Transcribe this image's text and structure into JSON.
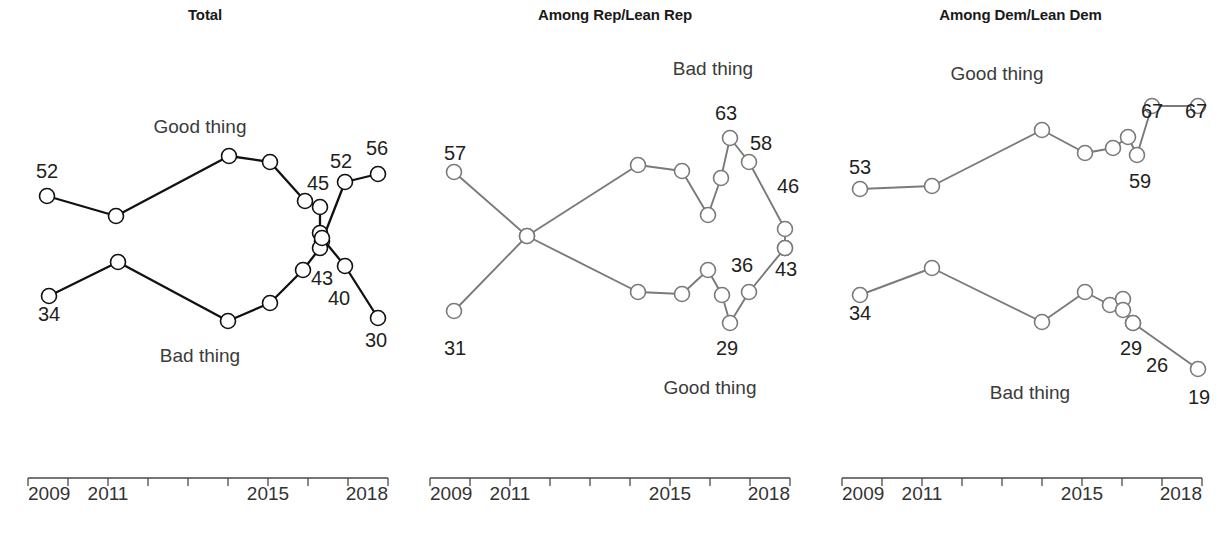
{
  "figure": {
    "background": "#ffffff",
    "panel_count": 3
  },
  "panels": [
    {
      "id": "total",
      "title": "Total",
      "line_color": "#111111",
      "marker_stroke": "#111111",
      "series_labels": [
        {
          "text": "Good thing",
          "x": 200,
          "y": 133
        },
        {
          "text": "Bad thing",
          "x": 200,
          "y": 362
        }
      ],
      "value_labels": [
        {
          "text": "52",
          "x": 47,
          "y": 178,
          "anchor": "middle"
        },
        {
          "text": "45",
          "x": 318,
          "y": 190,
          "anchor": "middle"
        },
        {
          "text": "52",
          "x": 341,
          "y": 168,
          "anchor": "middle"
        },
        {
          "text": "56",
          "x": 377,
          "y": 155,
          "anchor": "middle"
        },
        {
          "text": "34",
          "x": 49,
          "y": 321,
          "anchor": "middle"
        },
        {
          "text": "43",
          "x": 322,
          "y": 285,
          "anchor": "middle"
        },
        {
          "text": "40",
          "x": 339,
          "y": 305,
          "anchor": "middle"
        },
        {
          "text": "30",
          "x": 376,
          "y": 347,
          "anchor": "middle"
        }
      ],
      "axis": {
        "x0": 28,
        "x1": 388,
        "y": 478,
        "tick_count": 10,
        "tick_len": 8,
        "labels": [
          {
            "text": "2009",
            "x": 28,
            "y": 500
          },
          {
            "text": "2011",
            "x": 108,
            "y": 500
          },
          {
            "text": "2015",
            "x": 268,
            "y": 500
          },
          {
            "text": "2018",
            "x": 388,
            "y": 500
          }
        ]
      }
    },
    {
      "id": "rep_lean_rep",
      "title": "Among Rep/Lean Rep",
      "line_color": "#7a7a7a",
      "marker_stroke": "#7a7a7a",
      "series_labels": [
        {
          "text": "Bad thing",
          "x": 303,
          "y": 75
        },
        {
          "text": "Good thing",
          "x": 300,
          "y": 394
        }
      ],
      "value_labels": [
        {
          "text": "57",
          "x": 45,
          "y": 160,
          "anchor": "middle"
        },
        {
          "text": "31",
          "x": 45,
          "y": 355,
          "anchor": "middle"
        },
        {
          "text": "63",
          "x": 316,
          "y": 120,
          "anchor": "middle"
        },
        {
          "text": "58",
          "x": 351,
          "y": 150,
          "anchor": "middle"
        },
        {
          "text": "46",
          "x": 378,
          "y": 193,
          "anchor": "middle"
        },
        {
          "text": "36",
          "x": 332,
          "y": 272,
          "anchor": "middle"
        },
        {
          "text": "43",
          "x": 376,
          "y": 276,
          "anchor": "middle"
        },
        {
          "text": "29",
          "x": 317,
          "y": 355,
          "anchor": "middle"
        }
      ],
      "axis": {
        "x0": 20,
        "x1": 380,
        "y": 478,
        "tick_count": 10,
        "tick_len": 8,
        "labels": [
          {
            "text": "2009",
            "x": 20,
            "y": 500
          },
          {
            "text": "2011",
            "x": 100,
            "y": 500
          },
          {
            "text": "2015",
            "x": 260,
            "y": 500
          },
          {
            "text": "2018",
            "x": 380,
            "y": 500
          }
        ]
      }
    },
    {
      "id": "dem_lean_dem",
      "title": "Among Dem/Lean Dem",
      "line_color": "#7a7a7a",
      "marker_stroke": "#7a7a7a",
      "series_labels": [
        {
          "text": "Good thing",
          "x": 177,
          "y": 80
        },
        {
          "text": "Bad thing",
          "x": 210,
          "y": 399
        }
      ],
      "value_labels": [
        {
          "text": "53",
          "x": 40,
          "y": 174,
          "anchor": "middle"
        },
        {
          "text": "67",
          "x": 332,
          "y": 118,
          "anchor": "middle"
        },
        {
          "text": "67",
          "x": 376,
          "y": 118,
          "anchor": "middle"
        },
        {
          "text": "59",
          "x": 320,
          "y": 188,
          "anchor": "middle"
        },
        {
          "text": "34",
          "x": 40,
          "y": 320,
          "anchor": "middle"
        },
        {
          "text": "29",
          "x": 311,
          "y": 355,
          "anchor": "middle"
        },
        {
          "text": "26",
          "x": 337,
          "y": 372,
          "anchor": "middle"
        },
        {
          "text": "19",
          "x": 379,
          "y": 404,
          "anchor": "middle"
        }
      ],
      "axis": {
        "x0": 22,
        "x1": 382,
        "y": 478,
        "tick_count": 10,
        "tick_len": 8,
        "labels": [
          {
            "text": "2009",
            "x": 22,
            "y": 500
          },
          {
            "text": "2011",
            "x": 102,
            "y": 500
          },
          {
            "text": "2015",
            "x": 262,
            "y": 500
          },
          {
            "text": "2018",
            "x": 382,
            "y": 500
          }
        ]
      }
    }
  ],
  "chart_data": [
    {
      "type": "line",
      "title": "Total",
      "xlabel": "",
      "ylabel": "",
      "grid": false,
      "legend": "inline-labels",
      "xlim": [
        2009,
        2018.5
      ],
      "ylim": [
        25,
        60
      ],
      "x_ticks": [
        2009,
        2010,
        2011,
        2012,
        2013,
        2014,
        2015,
        2016,
        2017,
        2018
      ],
      "x_tick_labels": [
        "2009",
        "",
        "2011",
        "",
        "",
        "",
        "2015",
        "",
        "",
        "2018"
      ],
      "series": [
        {
          "name": "Good thing",
          "color": "#111111",
          "points": [
            {
              "x": 2009.3,
              "y": 52,
              "px": 47,
              "py": 196,
              "label": "52"
            },
            {
              "x": 2011.0,
              "y": 49,
              "px": 116,
              "py": 216,
              "label": ""
            },
            {
              "x": 2014.0,
              "y": 57,
              "px": 229,
              "py": 156,
              "label": ""
            },
            {
              "x": 2015.0,
              "y": 56,
              "px": 270,
              "py": 162,
              "label": ""
            },
            {
              "x": 2016.3,
              "y": 45,
              "px": 305,
              "py": 201,
              "label": "45"
            },
            {
              "x": 2016.7,
              "y": 44,
              "px": 320,
              "py": 207,
              "label": ""
            },
            {
              "x": 2017.0,
              "y": 40,
              "px": 320,
              "py": 233,
              "label": ""
            },
            {
              "x": 2017.2,
              "y": 39,
              "px": 322,
              "py": 241,
              "label": ""
            },
            {
              "x": 2017.5,
              "y": 52,
              "px": 345,
              "py": 182,
              "label": "52"
            },
            {
              "x": 2018.2,
              "y": 56,
              "px": 378,
              "py": 174,
              "label": "56"
            }
          ]
        },
        {
          "name": "Bad thing",
          "color": "#111111",
          "points": [
            {
              "x": 2009.3,
              "y": 34,
              "px": 49,
              "py": 296,
              "label": "34"
            },
            {
              "x": 2011.0,
              "y": 40,
              "px": 118,
              "py": 262,
              "label": ""
            },
            {
              "x": 2014.0,
              "y": 31,
              "px": 228,
              "py": 321,
              "label": ""
            },
            {
              "x": 2015.0,
              "y": 33,
              "px": 270,
              "py": 303,
              "label": ""
            },
            {
              "x": 2016.3,
              "y": 36,
              "px": 303,
              "py": 270,
              "label": ""
            },
            {
              "x": 2016.7,
              "y": 40,
              "px": 320,
              "py": 248,
              "label": ""
            },
            {
              "x": 2017.0,
              "y": 42,
              "px": 322,
              "py": 238,
              "label": "43"
            },
            {
              "x": 2017.5,
              "y": 38,
              "px": 345,
              "py": 266,
              "label": "40"
            },
            {
              "x": 2018.2,
              "y": 30,
              "px": 378,
              "py": 318,
              "label": "30"
            }
          ]
        }
      ]
    },
    {
      "type": "line",
      "title": "Among Rep/Lean Rep",
      "xlabel": "",
      "ylabel": "",
      "grid": false,
      "legend": "inline-labels",
      "xlim": [
        2009,
        2018.5
      ],
      "ylim": [
        25,
        65
      ],
      "x_ticks": [
        2009,
        2010,
        2011,
        2012,
        2013,
        2014,
        2015,
        2016,
        2017,
        2018
      ],
      "x_tick_labels": [
        "2009",
        "",
        "2011",
        "",
        "",
        "",
        "2015",
        "",
        "",
        "2018"
      ],
      "series": [
        {
          "name": "Bad thing",
          "color": "#7a7a7a",
          "points": [
            {
              "x": 2009.3,
              "y": 31,
              "px": 44,
              "py": 311,
              "label": "31"
            },
            {
              "x": 2011.2,
              "y": 44,
              "px": 117,
              "py": 236,
              "label": ""
            },
            {
              "x": 2014.0,
              "y": 56,
              "px": 228,
              "py": 165,
              "label": ""
            },
            {
              "x": 2015.0,
              "y": 55,
              "px": 272,
              "py": 171,
              "label": ""
            },
            {
              "x": 2016.3,
              "y": 48,
              "px": 298,
              "py": 215,
              "label": ""
            },
            {
              "x": 2016.7,
              "y": 54,
              "px": 311,
              "py": 178,
              "label": ""
            },
            {
              "x": 2017.0,
              "y": 63,
              "px": 320,
              "py": 138,
              "label": "63"
            },
            {
              "x": 2017.4,
              "y": 58,
              "px": 339,
              "py": 162,
              "label": "58"
            },
            {
              "x": 2018.2,
              "y": 46,
              "px": 375,
              "py": 229,
              "label": "46"
            },
            {
              "x": 2018.4,
              "y": 43,
              "px": 375,
              "py": 248,
              "label": ""
            }
          ]
        },
        {
          "name": "Good thing",
          "color": "#7a7a7a",
          "points": [
            {
              "x": 2009.3,
              "y": 57,
              "px": 44,
              "py": 172,
              "label": "57"
            },
            {
              "x": 2011.2,
              "y": 44,
              "px": 117,
              "py": 236,
              "label": ""
            },
            {
              "x": 2014.0,
              "y": 35,
              "px": 228,
              "py": 292,
              "label": ""
            },
            {
              "x": 2015.0,
              "y": 34,
              "px": 272,
              "py": 294,
              "label": ""
            },
            {
              "x": 2016.3,
              "y": 37,
              "px": 298,
              "py": 270,
              "label": ""
            },
            {
              "x": 2016.7,
              "y": 33,
              "px": 312,
              "py": 295,
              "label": ""
            },
            {
              "x": 2017.0,
              "y": 29,
              "px": 320,
              "py": 323,
              "label": "29"
            },
            {
              "x": 2017.4,
              "y": 36,
              "px": 339,
              "py": 292,
              "label": "36"
            },
            {
              "x": 2018.2,
              "y": 43,
              "px": 375,
              "py": 248,
              "label": "43"
            }
          ]
        }
      ]
    },
    {
      "type": "line",
      "title": "Among Dem/Lean Dem",
      "xlabel": "",
      "ylabel": "",
      "grid": false,
      "legend": "inline-labels",
      "xlim": [
        2009,
        2018.5
      ],
      "ylim": [
        15,
        70
      ],
      "x_ticks": [
        2009,
        2010,
        2011,
        2012,
        2013,
        2014,
        2015,
        2016,
        2017,
        2018
      ],
      "x_tick_labels": [
        "2009",
        "",
        "2011",
        "",
        "",
        "",
        "2015",
        "",
        "",
        "2018"
      ],
      "series": [
        {
          "name": "Good thing",
          "color": "#7a7a7a",
          "points": [
            {
              "x": 2009.3,
              "y": 53,
              "px": 40,
              "py": 189,
              "label": "53"
            },
            {
              "x": 2011.2,
              "y": 53,
              "px": 112,
              "py": 186,
              "label": ""
            },
            {
              "x": 2014.0,
              "y": 62,
              "px": 222,
              "py": 130,
              "label": ""
            },
            {
              "x": 2015.2,
              "y": 58,
              "px": 265,
              "py": 153,
              "label": ""
            },
            {
              "x": 2016.3,
              "y": 59,
              "px": 293,
              "py": 148,
              "label": ""
            },
            {
              "x": 2016.8,
              "y": 61,
              "px": 308,
              "py": 137,
              "label": ""
            },
            {
              "x": 2017.1,
              "y": 59,
              "px": 317,
              "py": 155,
              "label": "59"
            },
            {
              "x": 2017.6,
              "y": 67,
              "px": 332,
              "py": 106,
              "label": "67"
            },
            {
              "x": 2018.3,
              "y": 67,
              "px": 378,
              "py": 106,
              "label": "67"
            }
          ]
        },
        {
          "name": "Bad thing",
          "color": "#7a7a7a",
          "points": [
            {
              "x": 2009.3,
              "y": 34,
              "px": 40,
              "py": 295,
              "label": "34"
            },
            {
              "x": 2011.2,
              "y": 38,
              "px": 112,
              "py": 268,
              "label": ""
            },
            {
              "x": 2014.0,
              "y": 31,
              "px": 222,
              "py": 322,
              "label": ""
            },
            {
              "x": 2015.2,
              "y": 34,
              "px": 265,
              "py": 292,
              "label": ""
            },
            {
              "x": 2016.3,
              "y": 32,
              "px": 290,
              "py": 305,
              "label": ""
            },
            {
              "x": 2016.8,
              "y": 32,
              "px": 303,
              "py": 299,
              "label": ""
            },
            {
              "x": 2017.1,
              "y": 31,
              "px": 303,
              "py": 310,
              "label": ""
            },
            {
              "x": 2017.4,
              "y": 29,
              "px": 313,
              "py": 323,
              "label": "29"
            },
            {
              "x": 2017.8,
              "y": 26,
              "px": 313,
              "py": 323,
              "label": "26"
            },
            {
              "x": 2018.3,
              "y": 19,
              "px": 378,
              "py": 369,
              "label": "19"
            }
          ]
        }
      ]
    }
  ]
}
